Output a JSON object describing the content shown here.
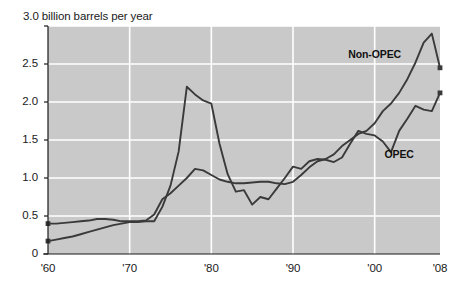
{
  "chart_data": {
    "type": "line",
    "title": "3.0 billion barrels per year",
    "xlabel": "",
    "ylabel": "billion barrels per year",
    "xlim": [
      1960,
      2008
    ],
    "ylim": [
      0,
      3.0
    ],
    "grid": true,
    "legend_position": "inline-annotations",
    "x_ticks": [
      "'60",
      "'70",
      "'80",
      "'90",
      "'00",
      "'08"
    ],
    "x_tick_values": [
      1960,
      1970,
      1980,
      1990,
      2000,
      2008
    ],
    "y_ticks": [
      "0",
      "0.5",
      "1.0",
      "1.5",
      "2.0",
      "2.5",
      "3.0"
    ],
    "y_tick_values": [
      0,
      0.5,
      1.0,
      1.5,
      2.0,
      2.5,
      3.0
    ],
    "plot_background": "#c9c9c9",
    "gridline_color": "#ffffff",
    "line_color": "#3a3a3a",
    "series": [
      {
        "name": "Non-OPEC",
        "label_x": 2000,
        "label_y": 2.62,
        "x": [
          1960,
          1961,
          1962,
          1963,
          1964,
          1965,
          1966,
          1967,
          1968,
          1969,
          1970,
          1971,
          1972,
          1973,
          1974,
          1975,
          1976,
          1977,
          1978,
          1979,
          1980,
          1981,
          1982,
          1983,
          1984,
          1985,
          1986,
          1987,
          1988,
          1989,
          1990,
          1991,
          1992,
          1993,
          1994,
          1995,
          1996,
          1997,
          1998,
          1999,
          2000,
          2001,
          2002,
          2003,
          2004,
          2005,
          2006,
          2007,
          2008
        ],
        "values": [
          0.4,
          0.4,
          0.41,
          0.42,
          0.43,
          0.44,
          0.46,
          0.46,
          0.45,
          0.43,
          0.43,
          0.43,
          0.44,
          0.52,
          0.72,
          0.8,
          0.9,
          1.0,
          1.12,
          1.1,
          1.04,
          0.98,
          0.95,
          0.93,
          0.93,
          0.94,
          0.95,
          0.95,
          0.93,
          0.92,
          0.95,
          1.04,
          1.14,
          1.22,
          1.25,
          1.31,
          1.42,
          1.5,
          1.58,
          1.62,
          1.72,
          1.88,
          1.98,
          2.12,
          2.3,
          2.52,
          2.78,
          2.9,
          2.45
        ]
      },
      {
        "name": "OPEC",
        "label_x": 2003,
        "label_y": 1.3,
        "x": [
          1960,
          1961,
          1962,
          1963,
          1964,
          1965,
          1966,
          1967,
          1968,
          1969,
          1970,
          1971,
          1972,
          1973,
          1974,
          1975,
          1976,
          1977,
          1978,
          1979,
          1980,
          1981,
          1982,
          1983,
          1984,
          1985,
          1986,
          1987,
          1988,
          1989,
          1990,
          1991,
          1992,
          1993,
          1994,
          1995,
          1996,
          1997,
          1998,
          1999,
          2000,
          2001,
          2002,
          2003,
          2004,
          2005,
          2006,
          2007,
          2008
        ],
        "values": [
          0.17,
          0.19,
          0.21,
          0.23,
          0.26,
          0.29,
          0.32,
          0.35,
          0.38,
          0.4,
          0.42,
          0.42,
          0.43,
          0.43,
          0.62,
          0.9,
          1.35,
          2.2,
          2.1,
          2.02,
          1.98,
          1.45,
          1.05,
          0.82,
          0.84,
          0.65,
          0.75,
          0.72,
          0.86,
          1.0,
          1.15,
          1.12,
          1.22,
          1.25,
          1.24,
          1.21,
          1.27,
          1.45,
          1.62,
          1.58,
          1.56,
          1.48,
          1.34,
          1.62,
          1.78,
          1.95,
          1.9,
          1.88,
          2.12
        ]
      }
    ],
    "markers": [
      {
        "series": "Non-OPEC",
        "x": 1960,
        "y": 0.4
      },
      {
        "series": "Non-OPEC",
        "x": 2008,
        "y": 2.45
      },
      {
        "series": "OPEC",
        "x": 1960,
        "y": 0.17
      },
      {
        "series": "OPEC",
        "x": 2008,
        "y": 2.12
      }
    ]
  }
}
